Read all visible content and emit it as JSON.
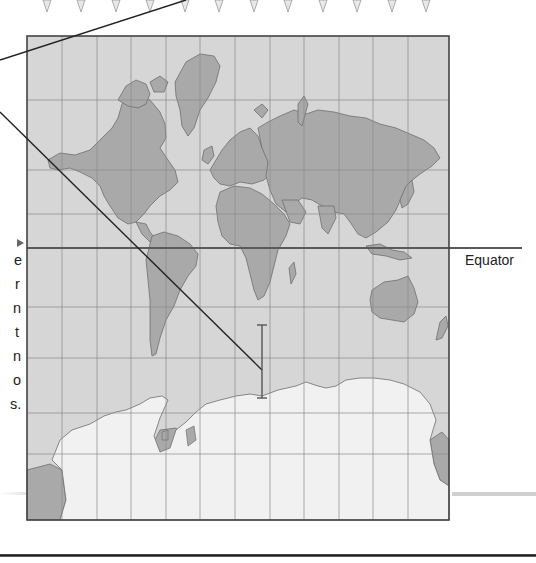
{
  "figure": {
    "type": "Mercator projection world map",
    "labels": {
      "equator": "Equator"
    },
    "left_caption_clipped_chars": [
      "e",
      "r",
      "n",
      "t",
      "n",
      "o",
      "s."
    ],
    "left_caption_arrow": "▸"
  },
  "colors": {
    "ocean": "#d6d6d6",
    "land": "#a9a9a9",
    "ice": "#f1f1f1",
    "grid": "#8a8a8a",
    "frame": "#444444",
    "leader_line": "#222222",
    "equator_line": "#5a5a5a",
    "text": "#222222"
  },
  "map_frame": {
    "x": 27,
    "y": 36,
    "width": 422,
    "height": 484
  },
  "grid": {
    "meridians_x": [
      62,
      97,
      131,
      166,
      200,
      235,
      270,
      304,
      339,
      373,
      408
    ],
    "parallels_y": [
      100,
      170,
      214,
      307,
      358,
      413,
      454
    ],
    "equator_y": 248
  },
  "top_markers_x": [
    47,
    81,
    116,
    150,
    185,
    219,
    254,
    288,
    323,
    357,
    392,
    426
  ]
}
